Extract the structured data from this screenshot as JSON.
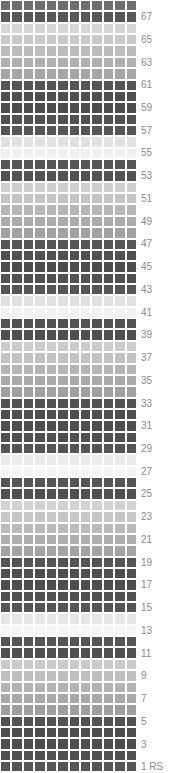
{
  "chart_data": {
    "type": "heatmap",
    "title": "",
    "xlabel": "",
    "ylabel": "",
    "columns": 12,
    "rows": 68,
    "row_label_suffix": "RS",
    "first_row_label": "1 RS",
    "legend_position": "right",
    "grid": true,
    "axis_note": "Row numbers shown on right edge, odd rows only, counting upward from bottom",
    "row_number_labels": [
      "67",
      "65",
      "63",
      "61",
      "59",
      "57",
      "55",
      "53",
      "51",
      "49",
      "47",
      "45",
      "43",
      "41",
      "39",
      "37",
      "35",
      "33",
      "31",
      "29",
      "27",
      "25",
      "23",
      "21",
      "19",
      "17",
      "15",
      "13",
      "11",
      "9",
      "7",
      "5",
      "3",
      "1 RS"
    ],
    "palette": {
      "very_dark": "#4d4d4d",
      "dark": "#565656",
      "mid_dark": "#777777",
      "mid": "#9a9a9a",
      "mid_light": "#b4b4b4",
      "light": "#c6c6c6",
      "lighter": "#d8d8d8",
      "very_light": "#e8e8e8",
      "near_white": "#f2f2f2",
      "white": "#fafafa",
      "background": "#ffffff",
      "label_text": "#8a8a8a"
    },
    "series": [
      {
        "name": "row-68",
        "row_number": 68,
        "value": "#6e6e6e"
      },
      {
        "name": "row-67",
        "row_number": 67,
        "value": "#585858"
      },
      {
        "name": "row-66",
        "row_number": 66,
        "value": "#d6d6d6"
      },
      {
        "name": "row-65",
        "row_number": 65,
        "value": "#c9c9c9"
      },
      {
        "name": "row-64",
        "row_number": 64,
        "value": "#bcbcbc"
      },
      {
        "name": "row-63",
        "row_number": 63,
        "value": "#b0b0b0"
      },
      {
        "name": "row-62",
        "row_number": 62,
        "value": "#a6a6a6"
      },
      {
        "name": "row-61",
        "row_number": 61,
        "value": "#545454"
      },
      {
        "name": "row-60",
        "row_number": 60,
        "value": "#4f4f4f"
      },
      {
        "name": "row-59",
        "row_number": 59,
        "value": "#4d4d4d"
      },
      {
        "name": "row-58",
        "row_number": 58,
        "value": "#525252"
      },
      {
        "name": "row-57",
        "row_number": 57,
        "value": "#565656"
      },
      {
        "name": "row-56",
        "row_number": 56,
        "value": "#e2e2e2"
      },
      {
        "name": "row-55",
        "row_number": 55,
        "value": "#f0f0f0"
      },
      {
        "name": "row-54",
        "row_number": 54,
        "value": "#565656"
      },
      {
        "name": "row-53",
        "row_number": 53,
        "value": "#515151"
      },
      {
        "name": "row-52",
        "row_number": 52,
        "value": "#cfcfcf"
      },
      {
        "name": "row-51",
        "row_number": 51,
        "value": "#c4c4c4"
      },
      {
        "name": "row-50",
        "row_number": 50,
        "value": "#b7b7b7"
      },
      {
        "name": "row-49",
        "row_number": 49,
        "value": "#ababab"
      },
      {
        "name": "row-48",
        "row_number": 48,
        "value": "#a2a2a2"
      },
      {
        "name": "row-47",
        "row_number": 47,
        "value": "#565656"
      },
      {
        "name": "row-46",
        "row_number": 46,
        "value": "#505050"
      },
      {
        "name": "row-45",
        "row_number": 45,
        "value": "#4d4d4d"
      },
      {
        "name": "row-44",
        "row_number": 44,
        "value": "#515151"
      },
      {
        "name": "row-43",
        "row_number": 43,
        "value": "#555555"
      },
      {
        "name": "row-42",
        "row_number": 42,
        "value": "#e0e0e0"
      },
      {
        "name": "row-41",
        "row_number": 41,
        "value": "#f2f2f2"
      },
      {
        "name": "row-40",
        "row_number": 40,
        "value": "#545454"
      },
      {
        "name": "row-39",
        "row_number": 39,
        "value": "#505050"
      },
      {
        "name": "row-38",
        "row_number": 38,
        "value": "#cccccc"
      },
      {
        "name": "row-37",
        "row_number": 37,
        "value": "#c2c2c2"
      },
      {
        "name": "row-36",
        "row_number": 36,
        "value": "#b5b5b5"
      },
      {
        "name": "row-35",
        "row_number": 35,
        "value": "#aaaaaa"
      },
      {
        "name": "row-34",
        "row_number": 34,
        "value": "#a0a0a0"
      },
      {
        "name": "row-33",
        "row_number": 33,
        "value": "#535353"
      },
      {
        "name": "row-32",
        "row_number": 32,
        "value": "#4f4f4f"
      },
      {
        "name": "row-31",
        "row_number": 31,
        "value": "#4d4d4d"
      },
      {
        "name": "row-30",
        "row_number": 30,
        "value": "#505050"
      },
      {
        "name": "row-29",
        "row_number": 29,
        "value": "#545454"
      },
      {
        "name": "row-28",
        "row_number": 28,
        "value": "#ebebeb"
      },
      {
        "name": "row-27",
        "row_number": 27,
        "value": "#f4f4f4"
      },
      {
        "name": "row-26",
        "row_number": 26,
        "value": "#565656"
      },
      {
        "name": "row-25",
        "row_number": 25,
        "value": "#505050"
      },
      {
        "name": "row-24",
        "row_number": 24,
        "value": "#d2d2d2"
      },
      {
        "name": "row-23",
        "row_number": 23,
        "value": "#c6c6c6"
      },
      {
        "name": "row-22",
        "row_number": 22,
        "value": "#bababa"
      },
      {
        "name": "row-21",
        "row_number": 21,
        "value": "#aeaeae"
      },
      {
        "name": "row-20",
        "row_number": 20,
        "value": "#a4a4a4"
      },
      {
        "name": "row-19",
        "row_number": 19,
        "value": "#545454"
      },
      {
        "name": "row-18",
        "row_number": 18,
        "value": "#4f4f4f"
      },
      {
        "name": "row-17",
        "row_number": 17,
        "value": "#4d4d4d"
      },
      {
        "name": "row-16",
        "row_number": 16,
        "value": "#515151"
      },
      {
        "name": "row-15",
        "row_number": 15,
        "value": "#555555"
      },
      {
        "name": "row-14",
        "row_number": 14,
        "value": "#e6e6e6"
      },
      {
        "name": "row-13",
        "row_number": 13,
        "value": "#f5f5f5"
      },
      {
        "name": "row-12",
        "row_number": 12,
        "value": "#555555"
      },
      {
        "name": "row-11",
        "row_number": 11,
        "value": "#505050"
      },
      {
        "name": "row-10",
        "row_number": 10,
        "value": "#cacaca"
      },
      {
        "name": "row-9",
        "row_number": 9,
        "value": "#bfbfbf"
      },
      {
        "name": "row-8",
        "row_number": 8,
        "value": "#b3b3b3"
      },
      {
        "name": "row-7",
        "row_number": 7,
        "value": "#a8a8a8"
      },
      {
        "name": "row-6",
        "row_number": 6,
        "value": "#9e9e9e"
      },
      {
        "name": "row-5",
        "row_number": 5,
        "value": "#525252"
      },
      {
        "name": "row-4",
        "row_number": 4,
        "value": "#4e4e4e"
      },
      {
        "name": "row-3",
        "row_number": 3,
        "value": "#4d4d4d"
      },
      {
        "name": "row-2",
        "row_number": 2,
        "value": "#505050"
      },
      {
        "name": "row-1",
        "row_number": 1,
        "value": "#555555"
      }
    ]
  }
}
